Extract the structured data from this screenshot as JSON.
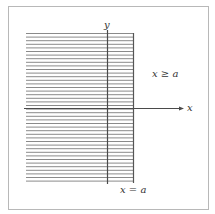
{
  "diagram": {
    "type": "half-plane region",
    "axes": {
      "x_label": "x",
      "y_label": "y"
    },
    "labels": {
      "region": "x ≥ a",
      "boundary": "x = a"
    },
    "colors": {
      "frame": "#b8b8b8",
      "axis": "#4a4a4a",
      "hatch": "#8a8a8a",
      "boundary": "#555555",
      "text": "#333333"
    }
  }
}
